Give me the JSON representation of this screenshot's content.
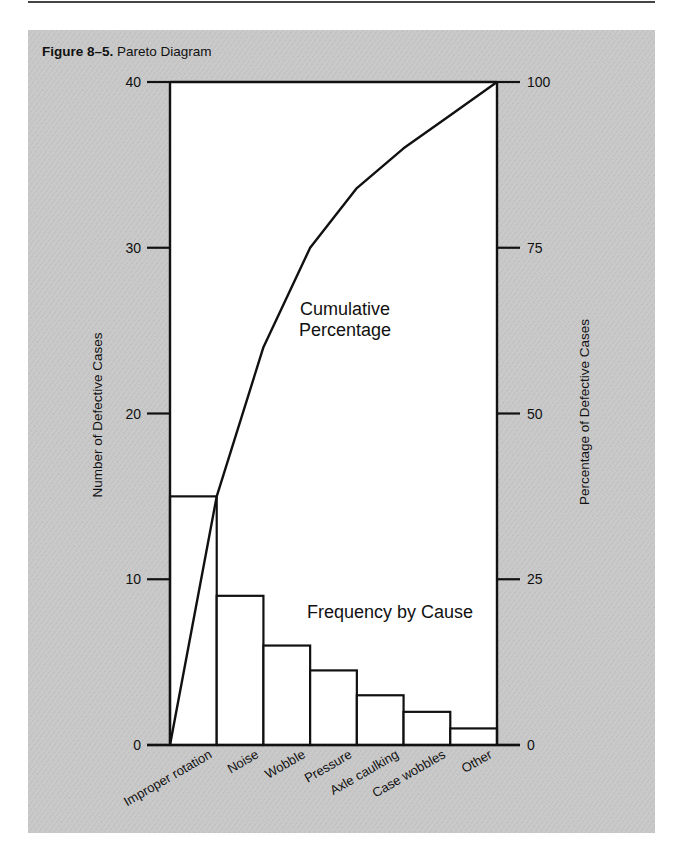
{
  "figure": {
    "label": "Figure 8–5.",
    "title": "Pareto Diagram"
  },
  "chart_data": {
    "type": "bar+line",
    "title": "Pareto Diagram",
    "categories": [
      "Improper rotation",
      "Noise",
      "Wobble",
      "Pressure",
      "Axle caulking",
      "Case wobbles",
      "Other"
    ],
    "series": [
      {
        "name": "Frequency by Cause",
        "type": "bar",
        "axis": "left",
        "values": [
          15,
          9,
          6,
          4.5,
          3,
          2,
          1
        ]
      },
      {
        "name": "Cumulative Percentage",
        "type": "line",
        "axis": "right",
        "values": [
          37.5,
          60,
          75,
          84,
          90,
          95,
          100
        ],
        "start_value": 0
      }
    ],
    "ylabel_left": "Number of Defective Cases",
    "ylabel_right": "Percentage of Defective Cases",
    "ylim_left": [
      0,
      40
    ],
    "ylim_right": [
      0,
      100
    ],
    "yticks_left": [
      "0",
      "10",
      "20",
      "30",
      "40"
    ],
    "yticks_right": [
      "0",
      "25",
      "50",
      "75",
      "100"
    ],
    "annotations": [
      "Cumulative Percentage",
      "Frequency by Cause"
    ],
    "grid": false,
    "legend": "none (inline annotations)"
  },
  "labels": {
    "left_axis": "Number of Defective Cases",
    "right_axis": "Percentage of Defective Cases",
    "cumulative_line1": "Cumulative",
    "cumulative_line2": "Percentage",
    "frequency": "Frequency by Cause",
    "ticks_left": [
      "0",
      "10",
      "20",
      "30",
      "40"
    ],
    "ticks_right": [
      "0",
      "25",
      "50",
      "75",
      "100"
    ],
    "categories": [
      "Improper rotation",
      "Noise",
      "Wobble",
      "Pressure",
      "Axle caulking",
      "Case wobbles",
      "Other"
    ]
  },
  "style": {
    "panel_color": "#c8c8c8",
    "plot_bg": "#ffffff",
    "line_color": "#111111"
  }
}
